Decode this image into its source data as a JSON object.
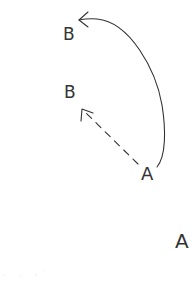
{
  "diagram": {
    "labels": {
      "b_top": "B",
      "b_mid": "B",
      "a_mid": "A",
      "a_bottom": "A"
    },
    "arrows": [
      {
        "from": "a_mid",
        "to": "b_top",
        "style": "solid-curved",
        "head": "open"
      },
      {
        "from": "a_mid",
        "to": "b_mid",
        "style": "dashed-straight",
        "head": "open"
      }
    ],
    "colors": {
      "ink": "#333333",
      "background": "#ffffff"
    }
  }
}
